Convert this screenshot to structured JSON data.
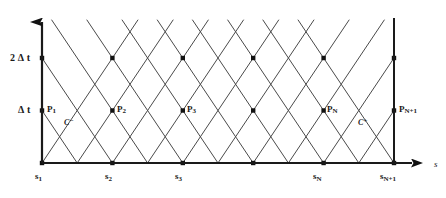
{
  "figure": {
    "kind": "characteristic-grid-diagram",
    "background_color": "#ffffff",
    "line_color": "#3d3d3d",
    "axis_color": "#1a1a1a",
    "node_color": "#111111"
  },
  "axes": {
    "horizontal": {
      "name": "s-axis",
      "label": "s",
      "label_x": 434,
      "label_y": 160,
      "y": 163,
      "x_start": 42,
      "x_end": 412,
      "arrow": "right"
    },
    "vertical": {
      "name": "t-axis",
      "label": "",
      "x": 42,
      "y_start": 163,
      "y_end": 22,
      "arrow": "up"
    },
    "right_boundary": {
      "name": "right-boundary-line",
      "x": 394,
      "y_top": 18,
      "y_bottom": 163
    }
  },
  "value_labels": [
    {
      "name": "level-2dt",
      "text": "2 Δ t",
      "x": 10,
      "y": 53
    },
    {
      "name": "level-dt",
      "text": "Δ t",
      "x": 18,
      "y": 105
    }
  ],
  "tick_labels": [
    {
      "name": "tick-s1",
      "base": "s",
      "sub": "1",
      "x": 35,
      "y": 172
    },
    {
      "name": "tick-s2",
      "base": "s",
      "sub": "2",
      "x": 105,
      "y": 172
    },
    {
      "name": "tick-s3",
      "base": "s",
      "sub": "3",
      "x": 175,
      "y": 172
    },
    {
      "name": "tick-sN",
      "base": "s",
      "sub": "N",
      "x": 313,
      "y": 172
    },
    {
      "name": "tick-sN1",
      "base": "s",
      "sub": "N+1",
      "x": 380,
      "y": 172
    }
  ],
  "point_labels": [
    {
      "name": "point-P1",
      "base": "P",
      "sub": "1",
      "x": 47,
      "y": 105
    },
    {
      "name": "point-P2",
      "base": "P",
      "sub": "2",
      "x": 117,
      "y": 105
    },
    {
      "name": "point-P3",
      "base": "P",
      "sub": "3",
      "x": 187,
      "y": 105
    },
    {
      "name": "point-PN",
      "base": "P",
      "sub": "N",
      "x": 327,
      "y": 105
    },
    {
      "name": "point-PN1",
      "base": "P",
      "sub": "N+1",
      "x": 399,
      "y": 105
    }
  ],
  "characteristic_labels": [
    {
      "name": "characteristic-c-minus",
      "base": "C",
      "sup": "−",
      "x": 64,
      "y": 118
    },
    {
      "name": "characteristic-c-plus",
      "base": "C",
      "sup": "+",
      "x": 358,
      "y": 118
    }
  ],
  "chart_data": {
    "type": "scatter",
    "title": "",
    "xlabel": "s",
    "ylabel": "",
    "geometry": {
      "origin_px": [
        42,
        163
      ],
      "column_spacing_px": 70.4,
      "row_spacing_px": 52.5,
      "columns_px": [
        42,
        112.4,
        182.8,
        253.2,
        323.6,
        394
      ],
      "rows_px": [
        163,
        110.5,
        58,
        20
      ],
      "half_column_px": 35.2
    },
    "columns": [
      "s1",
      "s2",
      "s3",
      "s4",
      "sN",
      "sN+1"
    ],
    "rows": [
      "0",
      "dt",
      "2dt"
    ],
    "nodes": [
      {
        "col": 0,
        "row": 0,
        "x": 42,
        "y": 163,
        "label": "s1"
      },
      {
        "col": 1,
        "row": 0,
        "x": 112.4,
        "y": 163,
        "label": "s2"
      },
      {
        "col": 2,
        "row": 0,
        "x": 182.8,
        "y": 163,
        "label": "s3"
      },
      {
        "col": 3,
        "row": 0,
        "x": 253.2,
        "y": 163,
        "label": ""
      },
      {
        "col": 4,
        "row": 0,
        "x": 323.6,
        "y": 163,
        "label": "sN"
      },
      {
        "col": 5,
        "row": 0,
        "x": 394,
        "y": 163,
        "label": "sN+1"
      },
      {
        "col": 0,
        "row": 1,
        "x": 42,
        "y": 110.5,
        "label": "P1"
      },
      {
        "col": 1,
        "row": 1,
        "x": 112.4,
        "y": 110.5,
        "label": "P2"
      },
      {
        "col": 2,
        "row": 1,
        "x": 182.8,
        "y": 110.5,
        "label": "P3"
      },
      {
        "col": 3,
        "row": 1,
        "x": 253.2,
        "y": 110.5,
        "label": ""
      },
      {
        "col": 4,
        "row": 1,
        "x": 323.6,
        "y": 110.5,
        "label": "PN"
      },
      {
        "col": 5,
        "row": 1,
        "x": 394,
        "y": 110.5,
        "label": "PN+1"
      },
      {
        "col": 0,
        "row": 2,
        "x": 42,
        "y": 58,
        "label": ""
      },
      {
        "col": 1,
        "row": 2,
        "x": 112.4,
        "y": 58,
        "label": ""
      },
      {
        "col": 2,
        "row": 2,
        "x": 182.8,
        "y": 58,
        "label": ""
      },
      {
        "col": 3,
        "row": 2,
        "x": 253.2,
        "y": 58,
        "label": ""
      },
      {
        "col": 4,
        "row": 2,
        "x": 323.6,
        "y": 58,
        "label": ""
      },
      {
        "col": 5,
        "row": 2,
        "x": 394,
        "y": 58,
        "label": ""
      }
    ],
    "top_crossings_px": [
      77.2,
      147.6,
      218,
      288.4,
      358.8
    ],
    "top_crossing_y": 33,
    "top_overshoot_y": 20
  }
}
